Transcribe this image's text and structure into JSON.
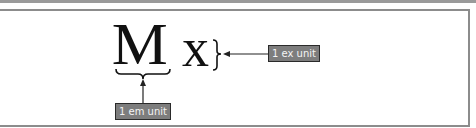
{
  "diagram": {
    "glyphs": {
      "em_glyph": "M",
      "ex_glyph": "x"
    },
    "labels": {
      "em": "1 em unit",
      "ex": "1 ex unit"
    },
    "annotations": [
      {
        "target": "width of M",
        "marker": "underbrace",
        "label": "1 em unit"
      },
      {
        "target": "height of x",
        "marker": "right-brace",
        "label": "1 ex unit"
      }
    ],
    "colors": {
      "label_fill": "#7d7d7d",
      "label_border": "#2a2a2a",
      "label_text": "#f4f4f4",
      "frame": "#8c8c8c",
      "glyph": "#111111"
    }
  }
}
